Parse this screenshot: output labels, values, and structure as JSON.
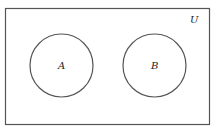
{
  "diagram": {
    "type": "venn",
    "universe": {
      "label": "U",
      "x": 5,
      "y": 8,
      "width": 204,
      "height": 116
    },
    "sets": [
      {
        "label": "A",
        "cx": 61.5,
        "cy": 65.5,
        "r": 31.5
      },
      {
        "label": "B",
        "cx": 154.5,
        "cy": 65.5,
        "r": 31.5
      }
    ],
    "colors": {
      "stroke": "#555555",
      "background": "#ffffff"
    }
  }
}
